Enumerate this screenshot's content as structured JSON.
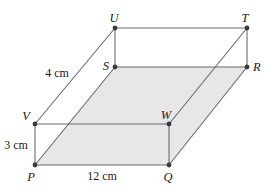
{
  "figure": {
    "canvas": {
      "width": 272,
      "height": 191
    },
    "style": {
      "background_color": "#ffffff",
      "edge_color": "#6b6b6b",
      "shaded_face_color": "#e7e7e7",
      "vertex_dot_color": "#3a3a3a",
      "label_color": "#1a1a1a"
    },
    "vertices": [
      {
        "id": "P",
        "label": "P",
        "x": 35,
        "y": 165,
        "label_x": 31,
        "label_y": 181,
        "anchor": "middle"
      },
      {
        "id": "Q",
        "label": "Q",
        "x": 169,
        "y": 165,
        "label_x": 168,
        "label_y": 181,
        "anchor": "middle"
      },
      {
        "id": "R",
        "label": "R",
        "x": 247,
        "y": 67,
        "label_x": 253,
        "label_y": 71,
        "anchor": "start"
      },
      {
        "id": "S",
        "label": "S",
        "x": 115,
        "y": 67,
        "label_x": 109,
        "label_y": 70,
        "anchor": "end"
      },
      {
        "id": "V",
        "label": "V",
        "x": 35,
        "y": 124,
        "label_x": 30,
        "label_y": 120,
        "anchor": "end"
      },
      {
        "id": "W",
        "label": "W",
        "x": 169,
        "y": 124,
        "label_x": 166,
        "label_y": 119,
        "anchor": "middle"
      },
      {
        "id": "T",
        "label": "T",
        "x": 247,
        "y": 28,
        "label_x": 245,
        "label_y": 22,
        "anchor": "middle"
      },
      {
        "id": "U",
        "label": "U",
        "x": 115,
        "y": 28,
        "label_x": 114,
        "label_y": 22,
        "anchor": "middle"
      }
    ],
    "shaded_faces": [
      {
        "name": "base-parallelogram-PQRS",
        "points": "35,165 169,165 247,67 115,67"
      }
    ],
    "edges": [
      {
        "name": "edge-PQ",
        "from": "P",
        "to": "Q"
      },
      {
        "name": "edge-QR",
        "from": "Q",
        "to": "R"
      },
      {
        "name": "edge-RS",
        "from": "R",
        "to": "S"
      },
      {
        "name": "edge-SP",
        "from": "S",
        "to": "P"
      },
      {
        "name": "edge-VW",
        "from": "V",
        "to": "W"
      },
      {
        "name": "edge-WT",
        "from": "W",
        "to": "T"
      },
      {
        "name": "edge-TU",
        "from": "T",
        "to": "U"
      },
      {
        "name": "edge-UV",
        "from": "U",
        "to": "V"
      },
      {
        "name": "edge-PV",
        "from": "P",
        "to": "V"
      },
      {
        "name": "edge-QW",
        "from": "Q",
        "to": "W"
      },
      {
        "name": "edge-RT",
        "from": "R",
        "to": "T"
      },
      {
        "name": "edge-SU",
        "from": "S",
        "to": "U"
      }
    ],
    "measurements": [
      {
        "name": "length-label-12cm",
        "text": "12 cm",
        "x": 102,
        "y": 180,
        "anchor": "middle",
        "describes": "edge-PQ"
      },
      {
        "name": "height-label-3cm",
        "text": "3 cm",
        "x": 16,
        "y": 149,
        "anchor": "middle",
        "describes": "edge-PV"
      },
      {
        "name": "slant-label-4cm",
        "text": "4 cm",
        "x": 57,
        "y": 77,
        "anchor": "middle",
        "describes": "edge-UV"
      }
    ]
  }
}
